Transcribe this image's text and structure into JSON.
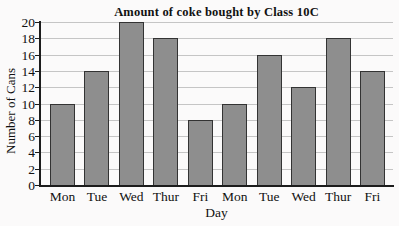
{
  "chart_data": {
    "type": "bar",
    "title": "Amount of coke bought by Class 10C",
    "xlabel": "Day",
    "ylabel": "Number of Cans",
    "categories": [
      "Mon",
      "Tue",
      "Wed",
      "Thur",
      "Fri",
      "Mon",
      "Tue",
      "Wed",
      "Thur",
      "Fri"
    ],
    "values": [
      10,
      14,
      20,
      18,
      8,
      10,
      16,
      12,
      18,
      14
    ],
    "ylim": [
      0,
      20
    ],
    "yticks": [
      0,
      2,
      4,
      6,
      8,
      10,
      12,
      14,
      16,
      18,
      20
    ],
    "grid": true,
    "legend": "none",
    "colors": {
      "bar_fill": "#8e8e8e",
      "bar_border": "#333333",
      "gridline": "#c5c5c5",
      "axis": "#1c1c1c",
      "text": "#111111",
      "background": "#fbfafa"
    }
  }
}
